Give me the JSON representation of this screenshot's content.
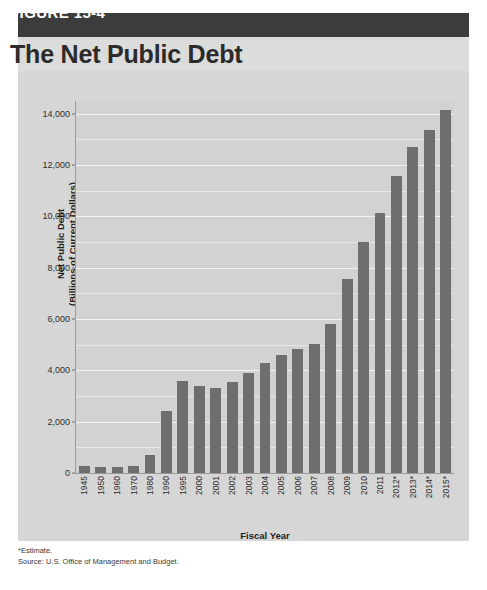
{
  "header": {
    "figure_label": "FIGURE 15-4",
    "title": "The Net Public Debt",
    "banner_color": "#3c3c3c",
    "titlebar_color": "#dcdcdc"
  },
  "footnotes": {
    "estimate_note": "*Estimate.",
    "source": "Source: U.S. Office of Management and Budget."
  },
  "chart_data": {
    "type": "bar",
    "title": "The Net Public Debt",
    "xlabel": "Fiscal Year",
    "ylabel": "Net Public Debt\n(Billions of Current Dollars)",
    "ylabel_line1": "Net Public Debt",
    "ylabel_line2": "(Billions of Current Dollars)",
    "ylim": [
      0,
      14500
    ],
    "yticks": [
      0,
      2000,
      4000,
      6000,
      8000,
      10000,
      12000,
      14000
    ],
    "ytick_labels": [
      "0",
      "2,000",
      "4,000",
      "6,000",
      "8,000",
      "10,000",
      "12,000",
      "14,000"
    ],
    "minor_gridline_step": 1000,
    "grid": true,
    "legend": false,
    "bar_color": "#6e6e6e",
    "plot_background": "#d2d2d2",
    "categories": [
      "1945",
      "1950",
      "1960",
      "1970",
      "1980",
      "1990",
      "1995",
      "2000",
      "2001",
      "2002",
      "2003",
      "2004",
      "2005",
      "2006",
      "2007",
      "2008",
      "2009",
      "2010",
      "2011",
      "2012*",
      "2013*",
      "2014*",
      "2015*"
    ],
    "values": [
      260,
      219,
      237,
      283,
      712,
      2412,
      3604,
      3410,
      3320,
      3540,
      3913,
      4296,
      4592,
      4829,
      5035,
      5803,
      7545,
      9019,
      10128,
      11578,
      12717,
      13362,
      14152
    ],
    "series": [
      {
        "name": "Net Public Debt",
        "values": [
          260,
          219,
          237,
          283,
          712,
          2412,
          3604,
          3410,
          3320,
          3540,
          3913,
          4296,
          4592,
          4829,
          5035,
          5803,
          7545,
          9019,
          10128,
          11578,
          12717,
          13362,
          14152
        ]
      }
    ]
  }
}
